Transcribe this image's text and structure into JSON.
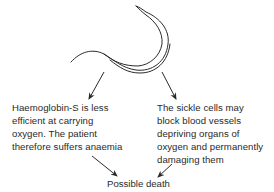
{
  "diagram": {
    "colors": {
      "stroke": "#2a2a2a",
      "text": "#2a2a2a",
      "background": "#ffffff"
    },
    "effects": [
      {
        "id": "anaemia",
        "lines": [
          "Haemoglobin-S is less",
          "efficient at carrying",
          "oxygen. The patient",
          "therefore suffers anaemia"
        ]
      },
      {
        "id": "vessel-blockage",
        "lines": [
          "The sickle cells may",
          "block blood vessels",
          "depriving organs of",
          "oxygen and permanently",
          "damaging them"
        ]
      }
    ],
    "outcome": {
      "label": "Possible death"
    },
    "edges": [
      {
        "from": "sickle-cell",
        "to": "anaemia"
      },
      {
        "from": "sickle-cell",
        "to": "vessel-blockage"
      },
      {
        "from": "anaemia",
        "to": "outcome"
      },
      {
        "from": "vessel-blockage",
        "to": "outcome"
      }
    ]
  }
}
